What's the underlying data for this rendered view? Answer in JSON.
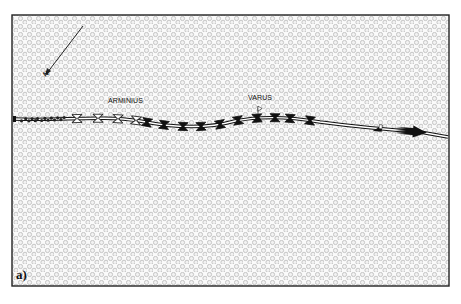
{
  "figure": {
    "panel_label": "a)",
    "background_pattern": "forest-dots",
    "colors": {
      "frame": "#222222",
      "forest_dot_stroke": "#b9b9b9",
      "route": "#111111",
      "route_fill": "#ffffff",
      "unit_black": "#111111"
    }
  },
  "compass": {
    "icon": "north-arrow-icon",
    "label": "N"
  },
  "forces": [
    {
      "id": "arminius",
      "label": "ARMINIUS"
    },
    {
      "id": "varus",
      "label": "VARUS"
    }
  ],
  "route": {
    "direction": "west-to-east",
    "segments": [
      {
        "type": "cluster",
        "symbol": "skirmish-cluster-icon"
      },
      {
        "type": "open-units",
        "symbol": "open-hourglass-icon",
        "count": 4
      },
      {
        "type": "black-units",
        "symbol": "black-hourglass-icon",
        "count": 8
      },
      {
        "type": "flag-marker",
        "symbol": "command-flag-icon"
      },
      {
        "type": "black-units",
        "symbol": "black-hourglass-icon",
        "count": 2
      },
      {
        "type": "triangle-marker",
        "symbol": "triangle-marker-icon"
      },
      {
        "type": "advance-arrow",
        "symbol": "gradient-arrow-icon"
      }
    ]
  }
}
